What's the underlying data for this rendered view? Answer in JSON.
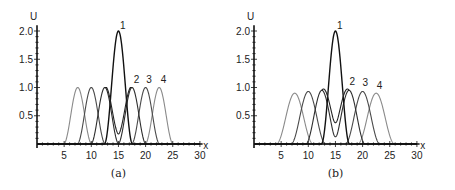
{
  "chart_data": [
    {
      "type": "line",
      "panel": "a",
      "caption": "(a)",
      "xlabel": "x",
      "ylabel": "U",
      "xlim": [
        0,
        30
      ],
      "ylim": [
        0,
        2.1
      ],
      "x_ticks": [
        5,
        10,
        15,
        20,
        25,
        30
      ],
      "x_tick_labels": [
        "5",
        "10",
        "15",
        "20",
        "25",
        "30"
      ],
      "y_ticks": [
        0.5,
        1.0,
        1.5,
        2.0
      ],
      "y_tick_labels": [
        "0.5",
        "1.0",
        "1.5",
        "2.0"
      ],
      "grid": false,
      "series": [
        {
          "name": "1",
          "color": "#111111",
          "description": "central peak height 2.0 at x=15 (sum of two pulses), dips to ~0.2 at x=15 when split",
          "points": [
            [
              10,
              0
            ],
            [
              12.5,
              1.0
            ],
            [
              15,
              2.0
            ],
            [
              17.5,
              1.0
            ],
            [
              20,
              0
            ]
          ]
        },
        {
          "name": "2",
          "color": "#333333",
          "points": [
            [
              7.5,
              0
            ],
            [
              10,
              1.0
            ],
            [
              12.5,
              0.3
            ],
            [
              15,
              0.2
            ],
            [
              17.5,
              1.0
            ],
            [
              20,
              0
            ]
          ]
        },
        {
          "name": "3",
          "color": "#555555",
          "points": [
            [
              7,
              0
            ],
            [
              10,
              1.0
            ],
            [
              12.5,
              0
            ],
            [
              17.5,
              0
            ],
            [
              20,
              1.0
            ],
            [
              23,
              0
            ]
          ]
        },
        {
          "name": "4",
          "color": "#888888",
          "points": [
            [
              5,
              0
            ],
            [
              7.5,
              1.0
            ],
            [
              10,
              0
            ],
            [
              20,
              0
            ],
            [
              22.5,
              1.0
            ],
            [
              25,
              0
            ]
          ]
        }
      ],
      "annotations": [
        "1",
        "2",
        "3",
        "4"
      ]
    },
    {
      "type": "line",
      "panel": "b",
      "caption": "(b)",
      "xlabel": "x",
      "ylabel": "U",
      "xlim": [
        0,
        30
      ],
      "ylim": [
        0,
        2.1
      ],
      "x_ticks": [
        5,
        10,
        15,
        20,
        25,
        30
      ],
      "x_tick_labels": [
        "5",
        "10",
        "15",
        "20",
        "25",
        "30"
      ],
      "y_ticks": [
        0.5,
        1.0,
        1.5,
        2.0
      ],
      "y_tick_labels": [
        "0.5",
        "1.0",
        "1.5",
        "2.0"
      ],
      "grid": false,
      "series": [
        {
          "name": "1",
          "color": "#111111",
          "points": [
            [
              10,
              0
            ],
            [
              12.5,
              0.95
            ],
            [
              15,
              2.0
            ],
            [
              17.5,
              0.95
            ],
            [
              20,
              0
            ]
          ]
        },
        {
          "name": "2",
          "color": "#333333",
          "points": [
            [
              7.5,
              0
            ],
            [
              10,
              0.93
            ],
            [
              12.5,
              0.95
            ],
            [
              15,
              0.27
            ],
            [
              17.5,
              0.95
            ],
            [
              20,
              0.93
            ]
          ]
        },
        {
          "name": "3",
          "color": "#555555",
          "points": [
            [
              7,
              0
            ],
            [
              10,
              0.93
            ],
            [
              13,
              0
            ],
            [
              17,
              0
            ],
            [
              20,
              0.93
            ],
            [
              23,
              0
            ]
          ]
        },
        {
          "name": "4",
          "color": "#888888",
          "points": [
            [
              4,
              0
            ],
            [
              7.5,
              0.9
            ],
            [
              11,
              0
            ],
            [
              19,
              0
            ],
            [
              22.5,
              0.9
            ],
            [
              26,
              0
            ]
          ]
        }
      ],
      "annotations": [
        "1",
        "2",
        "3",
        "4"
      ]
    }
  ],
  "panels": {
    "a": {
      "caption": "(a)",
      "xlabel": "x",
      "ylabel": "U",
      "ox": 37,
      "oy": 144,
      "sx": 5.43,
      "sy": 56.5,
      "peaks": {
        "outer": 1.0,
        "inner": 1.0,
        "center": 2.0,
        "dip": 0.17
      }
    },
    "b": {
      "caption": "(b)",
      "xlabel": "x",
      "ylabel": "U",
      "ox": 254,
      "oy": 144,
      "sx": 5.43,
      "sy": 56.5,
      "peaks": {
        "outer": 0.9,
        "inner": 0.93,
        "mid": 0.95,
        "center": 2.0,
        "dip": 0.27
      }
    }
  },
  "labels": {
    "c1": "1",
    "c2": "2",
    "c3": "3",
    "c4": "4"
  },
  "colors": {
    "c1": "#111111",
    "c2": "#2e2e2e",
    "c3": "#4a4a4a",
    "c4": "#8a8a8a"
  }
}
